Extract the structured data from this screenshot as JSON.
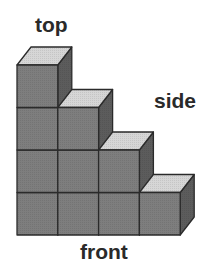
{
  "labels": {
    "top": "top",
    "side": "side",
    "front": "front"
  },
  "structure": {
    "description": "Staircase of stacked cubes",
    "column_heights": [
      4,
      3,
      2,
      1
    ]
  },
  "colors": {
    "front_face": "#7e7e7e",
    "top_face": "#d6d6d6",
    "side_face": "#5c5c5c",
    "edge": "#2b2b2b"
  }
}
